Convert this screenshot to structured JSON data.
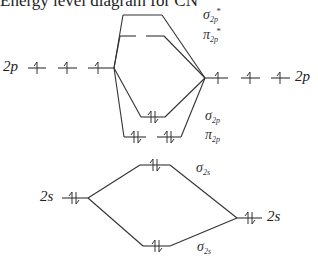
{
  "title": "Energy level diagram for CN",
  "atomic_orbitals": {
    "left_2p": {
      "label": "2p",
      "electrons": [
        "↑",
        "↑",
        "↑"
      ]
    },
    "right_2p": {
      "label": "2p",
      "electrons": [
        "↑",
        "↑",
        "↑"
      ]
    },
    "left_2s": {
      "label": "2s",
      "electrons": "↑↓"
    },
    "right_2s": {
      "label": "2s",
      "electrons": "↑↓"
    }
  },
  "molecular_orbitals": [
    {
      "name": "sigma_2p_star",
      "symbol": "σ",
      "sub": "2p",
      "sup": "*",
      "electrons": 0
    },
    {
      "name": "pi_2p_star",
      "symbol": "π",
      "sub": "2p",
      "sup": "*",
      "electrons": 0
    },
    {
      "name": "sigma_2p",
      "symbol": "σ",
      "sub": "2p",
      "sup": "",
      "electrons": 2
    },
    {
      "name": "pi_2p",
      "symbol": "π",
      "sub": "2p",
      "sup": "",
      "electrons": 4
    },
    {
      "name": "sigma_2s_upper",
      "symbol": "σ",
      "sub": "2s",
      "sup": "",
      "electrons": 2
    },
    {
      "name": "sigma_2s_lower",
      "symbol": "σ",
      "sub": "2s",
      "sup": "",
      "electrons": 2
    }
  ],
  "colors": {
    "line": "#333333",
    "text": "#222222"
  }
}
